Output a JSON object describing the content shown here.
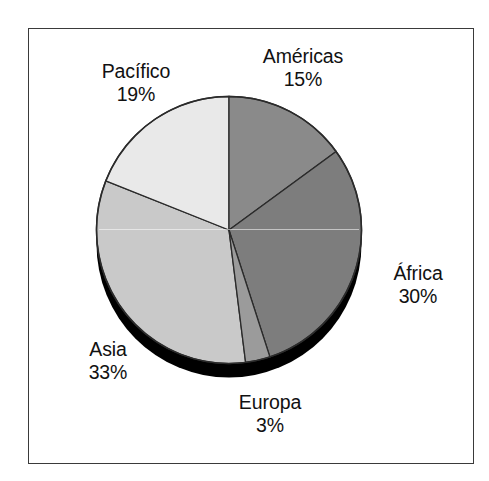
{
  "chart_data": {
    "type": "pie",
    "title": "",
    "subtitle": "",
    "xlabel": "",
    "ylabel": "",
    "legend_position": "none",
    "grid": false,
    "value_suffix": "%",
    "start_angle_deg": 0,
    "direction": "clockwise",
    "style": "3d-pie-with-shadow",
    "categories": [
      "Américas",
      "África",
      "Europa",
      "Asia",
      "Pacífico"
    ],
    "values": [
      15,
      30,
      3,
      33,
      19
    ],
    "labels": [
      "15%",
      "30%",
      "3%",
      "33%",
      "19%"
    ],
    "colors": [
      "#8a8a8a",
      "#7d7d7d",
      "#9b9b9b",
      "#c9c9c9",
      "#e9e9e9"
    ],
    "slices": [
      {
        "name": "Américas",
        "value": 15,
        "value_label": "15%",
        "color": "#8a8a8a"
      },
      {
        "name": "África",
        "value": 30,
        "value_label": "30%",
        "color": "#7d7d7d"
      },
      {
        "name": "Europa",
        "value": 3,
        "value_label": "3%",
        "color": "#9b9b9b"
      },
      {
        "name": "Asia",
        "value": 33,
        "value_label": "33%",
        "color": "#c9c9c9"
      },
      {
        "name": "Pacífico",
        "value": 19,
        "value_label": "19%",
        "color": "#e9e9e9"
      }
    ],
    "annotations": [
      {
        "text": "Américas",
        "value_label": "15%",
        "position": "top-right"
      },
      {
        "text": "Pacífico",
        "value_label": "19%",
        "position": "top-left"
      },
      {
        "text": "África",
        "value_label": "30%",
        "position": "right"
      },
      {
        "text": "Asia",
        "value_label": "33%",
        "position": "bottom-left"
      },
      {
        "text": "Europa",
        "value_label": "3%",
        "position": "bottom-center"
      }
    ]
  },
  "figure": {
    "border_color": "#3a3a3a",
    "background_color": "#ffffff",
    "shadow_color": "#000000",
    "outline_color": "#222222"
  }
}
